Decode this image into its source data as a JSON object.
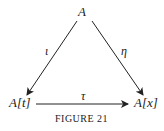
{
  "nodes": {
    "top": "A",
    "bottom_left": "A[t]",
    "bottom_right": "A[x]"
  },
  "edges": {
    "left": {
      "from": "A",
      "to": "A[t]",
      "label": "ι"
    },
    "right": {
      "from": "A",
      "to": "A[x]",
      "label": "η"
    },
    "bottom": {
      "from": "A[t]",
      "to": "A[x]",
      "label": "τ"
    }
  },
  "caption": "FIGURE 21"
}
